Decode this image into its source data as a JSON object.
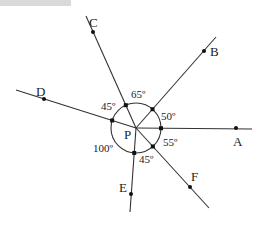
{
  "diagram": {
    "center": {
      "label": "P",
      "x": 136,
      "y": 128
    },
    "circle_radius": 25,
    "rays": [
      {
        "id": "A",
        "label": "A",
        "end": [
          252,
          129
        ],
        "dot": [
          236,
          128
        ],
        "label_pos": [
          233,
          146
        ]
      },
      {
        "id": "B",
        "label": "B",
        "end": [
          216,
          37
        ],
        "dot": [
          204,
          51
        ],
        "label_pos": [
          210,
          56
        ]
      },
      {
        "id": "C",
        "label": "C",
        "end": [
          86,
          16
        ],
        "dot": [
          93,
          32
        ],
        "label_pos": [
          89,
          27
        ]
      },
      {
        "id": "D",
        "label": "D",
        "end": [
          16,
          90
        ],
        "dot": [
          44,
          99
        ],
        "label_pos": [
          36,
          96
        ]
      },
      {
        "id": "E",
        "label": "E",
        "end": [
          130,
          212
        ],
        "dot": [
          131,
          194
        ],
        "label_pos": [
          119,
          192
        ]
      },
      {
        "id": "F",
        "label": "F",
        "end": [
          209,
          208
        ],
        "dot": [
          190,
          187
        ],
        "label_pos": [
          191,
          181
        ]
      }
    ],
    "angles": [
      {
        "between": "A-B",
        "label": "50º",
        "pos": [
          161,
          120
        ]
      },
      {
        "between": "B-C",
        "label": "65º",
        "pos": [
          131,
          98
        ]
      },
      {
        "between": "C-D",
        "label": "45º",
        "pos": [
          101,
          110
        ]
      },
      {
        "between": "D-E",
        "label": "100º",
        "pos": [
          93,
          152
        ]
      },
      {
        "between": "E-F",
        "label": "45º",
        "pos": [
          139,
          163
        ]
      },
      {
        "between": "F-A",
        "label": "55º",
        "pos": [
          163,
          146
        ]
      }
    ],
    "top_bar_color": "#d9d9d9",
    "line_color": "#333333"
  }
}
